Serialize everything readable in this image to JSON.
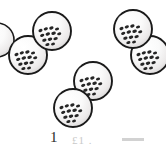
{
  "figure": {
    "background_color": "#ffffff",
    "width": 166,
    "height": 149,
    "outline_color": "#1a1a1a",
    "granule_color": "#262626",
    "fill_light": "#fdfdfd",
    "fill_shadow": "#d9d9d9",
    "highlight_color": "#ffffff"
  },
  "spheres": [
    {
      "id": "sphere-top-left-upper",
      "label": "sphere 1",
      "cx": 52,
      "cy": 31,
      "r": 19,
      "granule_cluster_cx": 52,
      "granule_cluster_cy": 35,
      "granule_count": 13
    },
    {
      "id": "sphere-left-lower",
      "label": "sphere 2",
      "cx": 28,
      "cy": 55,
      "r": 19,
      "granule_cluster_cx": 28,
      "granule_cluster_cy": 59,
      "granule_count": 13
    },
    {
      "id": "sphere-top-right-upper",
      "label": "sphere 3",
      "cx": 133,
      "cy": 29,
      "r": 19,
      "granule_cluster_cx": 133,
      "granule_cluster_cy": 33,
      "granule_count": 13
    },
    {
      "id": "sphere-right-lower",
      "label": "sphere 4",
      "cx": 150,
      "cy": 55,
      "r": 19,
      "granule_cluster_cx": 150,
      "granule_cluster_cy": 59,
      "granule_count": 12
    },
    {
      "id": "sphere-center",
      "label": "sphere 5",
      "cx": 93,
      "cy": 81,
      "r": 19,
      "granule_cluster_cx": 93,
      "granule_cluster_cy": 85,
      "granule_count": 13
    },
    {
      "id": "sphere-bottom",
      "label": "sphere 6",
      "cx": 73,
      "cy": 108,
      "r": 19,
      "granule_cluster_cx": 73,
      "granule_cluster_cy": 112,
      "granule_count": 13
    },
    {
      "id": "sphere-partial-left-edge",
      "label": "partial sphere at left edge",
      "cx": -3,
      "cy": 40,
      "r": 17,
      "granule_cluster_cx": -3,
      "granule_cluster_cy": 44,
      "granule_count": 0
    }
  ],
  "caption": {
    "number": "1",
    "trailing_text": "£1 .",
    "dash_present": true,
    "note": "caption partially cropped at bottom of image"
  }
}
